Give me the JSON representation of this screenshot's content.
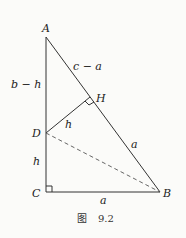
{
  "figure": {
    "caption_prefix": "图",
    "caption_number": "9.2",
    "points": {
      "A": "A",
      "B": "B",
      "C": "C",
      "D": "D",
      "H": "H"
    },
    "segment_labels": {
      "AD": "b − h",
      "AH": "c − a",
      "DH": "h",
      "DC": "h",
      "HB": "a",
      "CB": "a"
    },
    "right_angles": [
      "C",
      "H"
    ],
    "dashed_segments": [
      "DB"
    ]
  }
}
